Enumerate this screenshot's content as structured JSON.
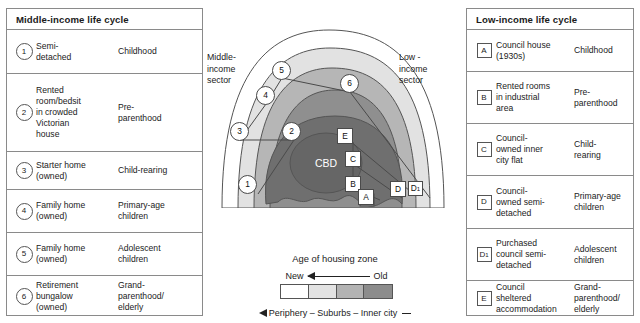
{
  "tables": {
    "middle": {
      "title": "Middle-income life cycle",
      "rows": [
        {
          "key": "1",
          "key_shape": "circle",
          "housing": "Semi-\ndetached",
          "stage": "Childhood"
        },
        {
          "key": "2",
          "key_shape": "circle",
          "housing": "Rented\nroom/bedsit\nin crowded\nVictorian\nhouse",
          "stage": "Pre-\nparenthood"
        },
        {
          "key": "3",
          "key_shape": "circle",
          "housing": "Starter home\n(owned)",
          "stage": "Child-rearing"
        },
        {
          "key": "4",
          "key_shape": "circle",
          "housing": "Family home\n(owned)",
          "stage": "Primary-age\nchildren"
        },
        {
          "key": "5",
          "key_shape": "circle",
          "housing": "Family home\n(owned)",
          "stage": "Adolescent\nchildren"
        },
        {
          "key": "6",
          "key_shape": "circle",
          "housing": "Retirement\nbungalow\n(owned)",
          "stage": "Grand-\nparenthood/\nelderly"
        }
      ]
    },
    "low": {
      "title": "Low-income life cycle",
      "rows": [
        {
          "key": "A",
          "key_shape": "square",
          "housing": "Council house\n(1930s)",
          "stage": "Childhood"
        },
        {
          "key": "B",
          "key_shape": "square",
          "housing": "Rented rooms\nin industrial\narea",
          "stage": "Pre-\nparenthood"
        },
        {
          "key": "C",
          "key_shape": "square",
          "housing": "Council-\nowned inner\ncity flat",
          "stage": "Child-\nrearing"
        },
        {
          "key": "D",
          "key_shape": "square",
          "housing": "Council-\nowned semi-\ndetached",
          "stage": "Primary-age\nchildren"
        },
        {
          "key": "D",
          "key_sub": "1",
          "key_shape": "square",
          "housing": "Purchased\ncouncil semi-\ndetached",
          "stage": "Adolescent\nchildren"
        },
        {
          "key": "E",
          "key_shape": "square",
          "housing": "Council\nsheltered\naccommodation",
          "stage": "Grand-\nparenthood/\nelderly"
        }
      ]
    }
  },
  "diagram": {
    "sector_labels": {
      "middle": "Middle-\nincome\nsector",
      "low": "Low -\nincome\nsector"
    },
    "core_label": "CBD",
    "caption": "Age of housing zone",
    "legend": {
      "new_label": "New",
      "old_label": "Old",
      "bands": [
        "#ffffff",
        "#e3e3e3",
        "#b3b3b3",
        "#8c8c8c"
      ],
      "gradient_note": "New ◄— Old"
    },
    "periphery_scale": "Periphery – Suburbs – Inner city",
    "zone_colors": {
      "outermost": "#ffffff",
      "outer": "#e0e0e0",
      "mid": "#b5b5b5",
      "inner": "#8d8d8d",
      "cbd": "#6e6e6e",
      "stroke": "#555555"
    },
    "markers": [
      {
        "label": "1",
        "shape": "circle",
        "x": 44,
        "y": 176
      },
      {
        "label": "2",
        "shape": "circle",
        "x": 86,
        "y": 123
      },
      {
        "label": "3",
        "shape": "circle",
        "x": 27,
        "y": 123
      },
      {
        "label": "4",
        "shape": "circle",
        "x": 52,
        "y": 87
      },
      {
        "label": "5",
        "shape": "circle",
        "x": 68,
        "y": 61
      },
      {
        "label": "6",
        "shape": "circle",
        "x": 137,
        "y": 75
      },
      {
        "label": "E",
        "shape": "square",
        "x": 133,
        "y": 126
      },
      {
        "label": "C",
        "shape": "square",
        "x": 141,
        "y": 149
      },
      {
        "label": "B",
        "shape": "square",
        "x": 141,
        "y": 174
      },
      {
        "label": "A",
        "shape": "square",
        "x": 153,
        "y": 187
      },
      {
        "label": "D",
        "shape": "square",
        "x": 164,
        "y": 179
      },
      {
        "label": "D",
        "sub": "1",
        "shape": "square",
        "x": 181,
        "y": 179
      }
    ]
  }
}
